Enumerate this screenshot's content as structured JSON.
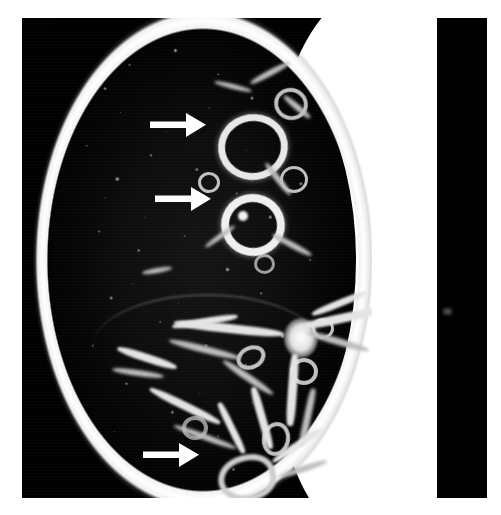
{
  "figure": {
    "modality": "CT",
    "view": "axial",
    "window": "lung window",
    "body_region": "chest",
    "laterality": "right lung",
    "background_color": "#ffffff",
    "scan_background_color": "#000000",
    "annotation_color": "#ffffff"
  },
  "canvas": {
    "width": 501,
    "height": 515,
    "scan_frame": {
      "x": 22,
      "y": 18,
      "width": 415,
      "height": 480
    },
    "right_black_strip": {
      "x": 437,
      "y": 18,
      "width": 50,
      "height": 480
    }
  },
  "annotations": {
    "arrows": [
      {
        "id": "arrow-1",
        "label": "arrow-upper",
        "points_to": "upper anterior thick-walled cyst",
        "x": 150,
        "y": 112,
        "length": 52,
        "direction": "right"
      },
      {
        "id": "arrow-2",
        "label": "arrow-middle",
        "points_to": "mid anterior thick-walled cyst with internal nodule",
        "x": 155,
        "y": 186,
        "length": 52,
        "direction": "right"
      },
      {
        "id": "arrow-3",
        "label": "arrow-lower",
        "points_to": "lower lobe bronchiectatic airway",
        "x": 143,
        "y": 442,
        "length": 52,
        "direction": "right"
      }
    ]
  },
  "regions": {
    "chest_wall": "bright curved subcutaneous fat and rib margin along the lateral chest",
    "mediastinum": "white soft-tissue mediastinum at the medial border",
    "lung_parenchyma": "dark mottled lung field with scattered vessel cross-sections",
    "hilum": "bright branching bronchovascular bundles converging centrally",
    "fissure": "faint linear interlobar fissure crossing the mid lung"
  }
}
